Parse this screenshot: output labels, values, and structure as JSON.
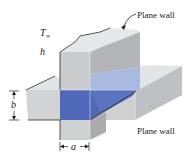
{
  "figure": {
    "labels": {
      "top_wall": "Plane wall",
      "bottom_wall": "Plane wall",
      "temperature": "T",
      "temperature_sub": "∞",
      "convection": "h",
      "dim_b": "b",
      "dim_a": "a"
    },
    "colors": {
      "wall_light": "#e6e7e9",
      "wall_mid": "#c9cacc",
      "wall_dark": "#a9abae",
      "blue_light": "#a9b9e0",
      "blue_dark": "#4f68b8",
      "outline": "#2a2a2a"
    }
  }
}
